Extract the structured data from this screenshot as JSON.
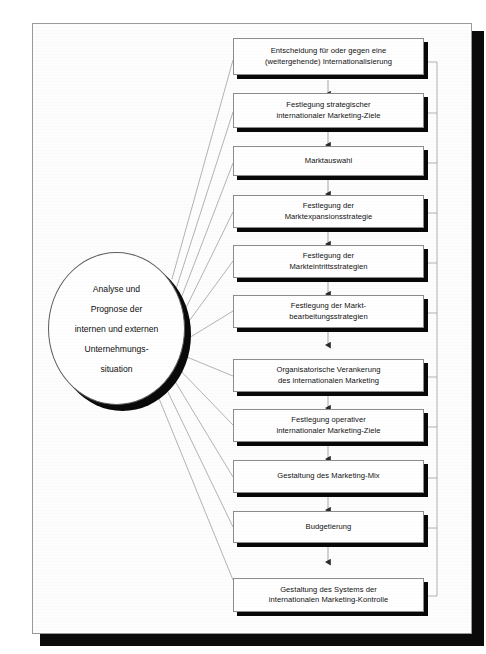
{
  "diagram": {
    "hub": {
      "name": "analysis-hub",
      "lines": [
        "Analyse und",
        "Prognose der",
        "internen und externen",
        "Unternehmungs-",
        "situation"
      ]
    },
    "steps": [
      {
        "id": "step-1",
        "label": "Entscheidung für oder gegen eine\n(weitergehende) Internationalisierung"
      },
      {
        "id": "step-2",
        "label": "Festlegung strategischer\ninternationaler Marketing-Ziele"
      },
      {
        "id": "step-3",
        "label": "Marktauswahl"
      },
      {
        "id": "step-4",
        "label": "Festlegung der\nMarktexpansionsstrategie"
      },
      {
        "id": "step-5",
        "label": "Festlegung der\nMarkteintrittsstrategien"
      },
      {
        "id": "step-6",
        "label": "Festlegung der Markt-\nbearbeitungsstrategien"
      },
      {
        "id": "step-7",
        "label": "Organisatorische Verankerung\ndes internationalen Marketing"
      },
      {
        "id": "step-8",
        "label": "Festlegung operativer\ninternationaler Marketing-Ziele"
      },
      {
        "id": "step-9",
        "label": "Gestaltung des Marketing-Mix"
      },
      {
        "id": "step-10",
        "label": "Budgetierung"
      },
      {
        "id": "step-11",
        "label": "Gestaltung des Systems der\ninternationalen Marketing-Kontrolle"
      }
    ],
    "colors": {
      "box_fill": "#ffffff",
      "box_border": "#8c8c8c",
      "shadow": "#080808",
      "connector": "#9c9c9c",
      "arrow": "#2a2a2a",
      "page": "#fdfdfd"
    }
  }
}
